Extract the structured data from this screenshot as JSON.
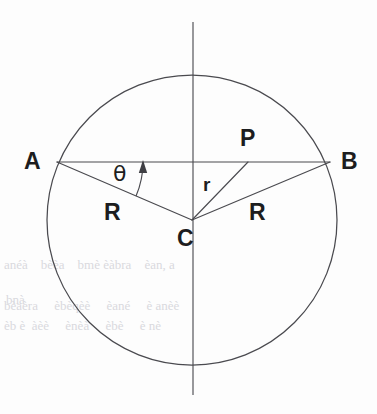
{
  "figure": {
    "kind": "geometry-diagram",
    "background_color": "#fdfdfd",
    "stroke_color": "#4a4a4f",
    "label_color": "#1d1d20",
    "canvas": {
      "width": 377,
      "height": 414
    }
  },
  "circle": {
    "name": "main-circle",
    "center_x": 192,
    "center_y": 220,
    "radius": 145
  },
  "axis": {
    "name": "vertical-axis",
    "x": 193,
    "y_top": 22,
    "y_bottom": 395
  },
  "points": {
    "A": {
      "label": "A",
      "x": 57,
      "y": 162,
      "label_x": 24,
      "label_y": 150
    },
    "B": {
      "label": "B",
      "x": 330,
      "y": 162,
      "label_x": 341,
      "label_y": 150
    },
    "C": {
      "label": "C",
      "x": 192,
      "y": 220,
      "label_x": 177,
      "label_y": 227
    },
    "P": {
      "label": "P",
      "x": 248,
      "y": 162,
      "label_x": 240,
      "label_y": 127
    }
  },
  "segments": [
    {
      "name": "chord-ab",
      "from": "A",
      "to": "B"
    },
    {
      "name": "radius-ca",
      "from": "C",
      "to": "A",
      "label": "R"
    },
    {
      "name": "radius-cb",
      "from": "C",
      "to": "B",
      "label": "R"
    },
    {
      "name": "segment-cp",
      "from": "C",
      "to": "P",
      "label": "r"
    }
  ],
  "labels": {
    "radius_left": {
      "text": "R",
      "x": 104,
      "y": 201
    },
    "radius_right": {
      "text": "R",
      "x": 249,
      "y": 201
    },
    "segment_r": {
      "text": "r",
      "x": 203,
      "y": 175
    },
    "angle_theta": {
      "text": "θ",
      "x": 113,
      "y": 163
    }
  },
  "angle_marker": {
    "name": "theta-angle-arc",
    "vertex": "A",
    "between": [
      "chord-ab",
      "radius-ca"
    ],
    "arrow_direction": "up",
    "arrow_tip_x": 143,
    "arrow_tip_y": 160
  },
  "ghost_text": {
    "line1": "bnà",
    "line2": "anéà    bèèa    bmè èàbra    èan, a",
    "line3": "bèaèra     èbèqèè     èané     è anèè",
    "line4": "èb è  àèè     ènèà     èbè     è nè"
  }
}
